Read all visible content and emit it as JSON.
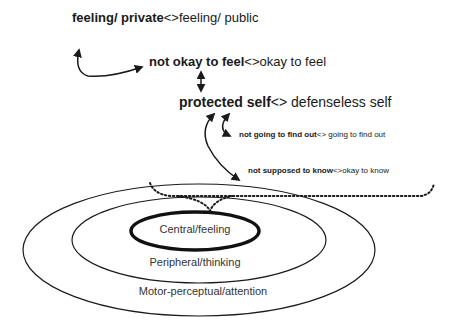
{
  "labels": {
    "row1": {
      "bold": "feeling/ private",
      "sep": "<>",
      "normal": "feeling/ public"
    },
    "row2": {
      "bold": "not okay to feel",
      "sep": "<>",
      "normal": "okay to feel"
    },
    "row3": {
      "bold": "protected self",
      "sep": "<>",
      "normal": " defenseless self"
    },
    "row4": {
      "bold": "not going to find out",
      "sep": "<>",
      "normal": " going to find out"
    },
    "row5": {
      "bold": "not supposed to know",
      "sep": "<>",
      "normal": "okay to know"
    }
  },
  "rings": {
    "central": "Central/feeling",
    "peripheral": "Peripheral/thinking",
    "motor": "Motor-perceptual/attention"
  },
  "colors": {
    "stroke": "#1a1a1a",
    "text": "#2a2a2a",
    "background": "#ffffff"
  }
}
